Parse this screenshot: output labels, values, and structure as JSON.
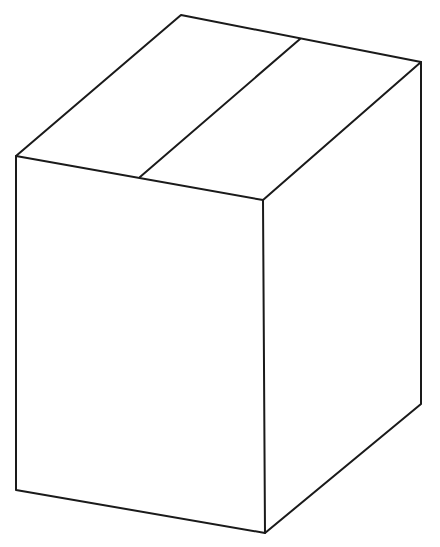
{
  "figure": {
    "background_color": "#ffffff",
    "line_color": "#1a1a1a",
    "fill_color": "#ffffff",
    "line_width": 2,
    "canvas": {
      "width": 440,
      "height": 547
    },
    "caption": "",
    "vertices": {
      "top_apex": [
        181,
        15
      ],
      "top_right": [
        421,
        62
      ],
      "top_left": [
        16,
        156
      ],
      "center": [
        263,
        200
      ],
      "bottom_left": [
        16,
        490
      ],
      "bottom_center": [
        265,
        533
      ],
      "bottom_right": [
        421,
        404
      ],
      "seam_top_end": [
        300,
        39
      ],
      "seam_bottom_end": [
        140,
        177
      ]
    },
    "faces": [
      {
        "name": "top-face",
        "label": "Top face",
        "points": "181,15 421,62 263,200 16,156"
      },
      {
        "name": "front-face",
        "label": "Front face",
        "points": "16,156 263,200 265,533 16,490"
      },
      {
        "name": "right-face",
        "label": "Right side face",
        "points": "263,200 421,62 421,404 265,533"
      }
    ],
    "seam_lines": [
      {
        "name": "flap-seam",
        "label": "Top flap seam",
        "from": [
          300,
          39
        ],
        "to": [
          140,
          177
        ]
      }
    ],
    "edges": [
      {
        "name": "top-back-left-edge",
        "from": [
          16,
          156
        ],
        "to": [
          181,
          15
        ]
      },
      {
        "name": "top-back-right-edge",
        "from": [
          181,
          15
        ],
        "to": [
          421,
          62
        ]
      },
      {
        "name": "top-front-right-edge",
        "from": [
          421,
          62
        ],
        "to": [
          263,
          200
        ]
      },
      {
        "name": "top-front-left-edge",
        "from": [
          263,
          200
        ],
        "to": [
          16,
          156
        ]
      },
      {
        "name": "front-left-vertical-edge",
        "from": [
          16,
          156
        ],
        "to": [
          16,
          490
        ]
      },
      {
        "name": "front-bottom-edge",
        "from": [
          16,
          490
        ],
        "to": [
          265,
          533
        ]
      },
      {
        "name": "center-vertical-edge",
        "from": [
          263,
          200
        ],
        "to": [
          265,
          533
        ]
      },
      {
        "name": "right-bottom-edge",
        "from": [
          265,
          533
        ],
        "to": [
          421,
          404
        ]
      },
      {
        "name": "right-vertical-edge",
        "from": [
          421,
          62
        ],
        "to": [
          421,
          404
        ]
      }
    ]
  }
}
